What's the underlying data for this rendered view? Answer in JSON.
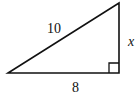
{
  "diagram": {
    "type": "right-triangle",
    "hypotenuse_label": "10",
    "vertical_leg_label": "x",
    "base_label": "8",
    "right_angle_marker": "bottom-right",
    "stroke_color": "#111111"
  }
}
